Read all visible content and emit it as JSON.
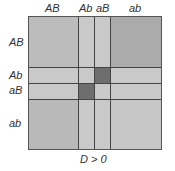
{
  "diagram": {
    "col_labels": [
      "AB",
      "Ab",
      "aB",
      "ab"
    ],
    "row_labels": [
      "AB",
      "Ab",
      "aB",
      "ab"
    ],
    "caption": "D > 0",
    "colors": {
      "base": "#c9c9c9",
      "medium": "#bababa",
      "quadrant_AB_ab": "#ababab",
      "dark": "#6e6e6e",
      "line": "#444444"
    },
    "highlighted_cells": [
      {
        "row": "Ab",
        "col": "aB"
      },
      {
        "row": "aB",
        "col": "Ab"
      }
    ]
  }
}
